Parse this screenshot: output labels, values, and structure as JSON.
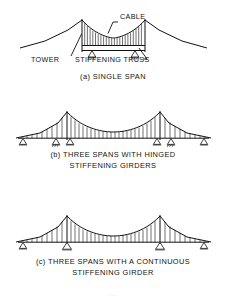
{
  "figure": {
    "ink_color": "#111111",
    "background_color": "#ffffff",
    "page_mark": "---"
  },
  "panels": [
    {
      "id": "a",
      "caption": "(a) SINGLE SPAN",
      "annotations": [
        {
          "id": "cable",
          "label": "CABLE"
        },
        {
          "id": "tower",
          "label": "TOWER"
        },
        {
          "id": "stiffening-truss",
          "label": "STIFFENING TRUSS"
        }
      ],
      "supports": 2,
      "towers": 2,
      "hangers": 23
    },
    {
      "id": "b",
      "caption_line1": "(b) THREE SPANS WITH HINGED",
      "caption_line2": "STIFFENING GIRDERS",
      "supports": 6,
      "towers": 2,
      "hangers": 37
    },
    {
      "id": "c",
      "caption_line1": "(c) THREE SPANS WITH A CONTINUOUS",
      "caption_line2": "STIFFENING GIRDER",
      "supports": 4,
      "towers": 2,
      "hangers": 37
    }
  ]
}
